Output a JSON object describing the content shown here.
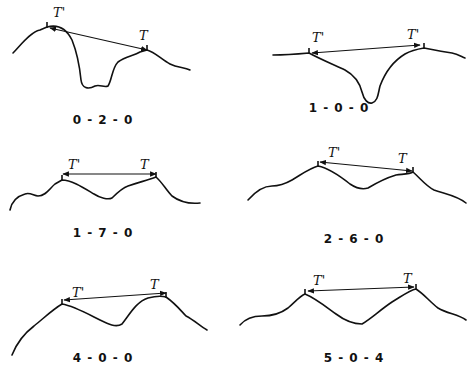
{
  "figure": {
    "panels": [
      {
        "code": "0 - 2 - 0",
        "left_marker": "T'",
        "right_marker": "T",
        "profile": "M13,53 C20,46 30,32 40,30 L47,27 C58,24 66,28 72,40 C78,55 80,70 81,80 C82,88 88,90 95,86 C100,84 104,88 108,86 C112,80 112,68 118,62 C126,56 134,56 140,52 L147,50 C155,52 162,60 170,64 C178,68 184,67 190,70",
        "arrow": [
          50,
          28,
          147,
          50
        ],
        "left_tick": [
          47,
          27
        ],
        "right_tick": [
          147,
          50
        ],
        "left_label_pos": [
          53,
          17
        ],
        "right_label_pos": [
          139,
          40
        ],
        "code_pos": [
          103,
          124
        ]
      },
      {
        "code": "1 - 0 - 0",
        "left_marker": "T'",
        "right_marker": "T'",
        "profile": "M273,55 C285,55 298,54 309,53 C318,58 332,64 345,70 C356,76 360,84 362,92 C364,100 368,104 372,103 C378,101 378,94 380,86 C386,70 395,60 405,54 C412,50 418,49 424,48 C434,50 444,52 452,53 C458,54 462,57 465,58",
        "arrow": [
          312,
          53,
          420,
          45
        ],
        "left_tick": [
          309,
          53
        ],
        "right_tick": [
          424,
          48
        ],
        "left_label_pos": [
          312,
          42
        ],
        "right_label_pos": [
          407,
          39
        ],
        "code_pos": [
          339,
          112
        ]
      },
      {
        "code": "1 - 7 - 0",
        "left_marker": "T'",
        "right_marker": "T",
        "profile": "M10,210 C12,200 18,196 25,194 C30,192 34,196 38,196 C46,196 50,188 55,184 L62,180 C72,180 84,188 94,194 C100,198 108,200 112,198 C118,192 122,188 128,186 C140,182 148,180 156,177 C162,182 166,190 172,196 C180,202 190,204 200,203",
        "arrow": [
          63,
          174,
          156,
          174
        ],
        "left_tick": [
          62,
          180
        ],
        "right_tick": [
          156,
          177
        ],
        "left_label_pos": [
          68,
          169
        ],
        "right_label_pos": [
          140,
          169
        ],
        "code_pos": [
          103,
          237
        ]
      },
      {
        "code": "2 - 6 - 0",
        "left_marker": "T'",
        "right_marker": "T",
        "profile": "M248,200 C255,192 262,186 272,186 C280,186 285,184 292,180 C302,174 310,168 318,166 C328,168 340,176 350,184 C356,188 362,190 368,188 C378,182 386,178 396,175 C404,174 410,174 413,172 C420,178 426,186 434,190 C446,194 458,196 466,203",
        "arrow": [
          320,
          162,
          412,
          171
        ],
        "left_tick": [
          318,
          166
        ],
        "right_tick": [
          413,
          172
        ],
        "left_label_pos": [
          328,
          157
        ],
        "right_label_pos": [
          398,
          163
        ],
        "code_pos": [
          354,
          243
        ]
      },
      {
        "code": "4 - 0 - 0",
        "left_marker": "T'",
        "right_marker": "T",
        "profile": "M12,355 C18,340 26,332 34,326 C44,318 52,310 62,304 C74,306 88,314 100,320 C108,324 116,328 122,324 C130,314 136,302 148,298 C156,296 162,296 166,297 C176,304 182,312 186,316 C194,320 200,326 207,330",
        "arrow": [
          64,
          300,
          166,
          293
        ],
        "left_tick": [
          62,
          304
        ],
        "right_tick": [
          166,
          297
        ],
        "left_label_pos": [
          72,
          297
        ],
        "right_label_pos": [
          150,
          289
        ],
        "code_pos": [
          103,
          362
        ]
      },
      {
        "code": "5 - 0 - 4",
        "left_marker": "T'",
        "right_marker": "T",
        "profile": "M240,325 C246,318 254,316 262,316 C272,316 280,314 288,308 C295,302 300,296 305,294 C315,298 325,306 336,314 C344,320 354,324 362,324 C372,318 380,310 392,302 C402,296 410,290 416,289 C424,294 430,302 438,308 C448,314 458,314 466,320",
        "arrow": [
          308,
          291,
          414,
          287
        ],
        "left_tick": [
          305,
          294
        ],
        "right_tick": [
          416,
          289
        ],
        "left_label_pos": [
          313,
          285
        ],
        "right_label_pos": [
          403,
          283
        ],
        "code_pos": [
          354,
          362
        ]
      }
    ]
  }
}
